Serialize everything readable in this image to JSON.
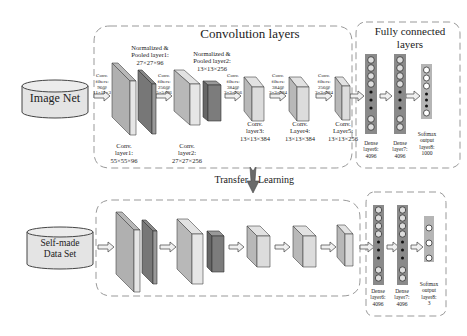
{
  "top": {
    "dataset_label": "Image Net",
    "conv_section_title": "Convolution layers",
    "fc_section_title_line1": "Fully connected",
    "fc_section_title_line2": "layers",
    "arrows": [
      {
        "l1": "Conv.",
        "l2": "filters:",
        "l3": "96@",
        "l4": "11×11×3"
      },
      {
        "l1": "Conv.",
        "l2": "filters:",
        "l3": "256@",
        "l4": "5×5×96"
      },
      {
        "l1": "Conv.",
        "l2": "filters:",
        "l3": "384@",
        "l4": "3×3×256"
      },
      {
        "l1": "Conv.",
        "l2": "filters:",
        "l3": "384@",
        "l4": "3×3×384"
      },
      {
        "l1": "Conv.",
        "l2": "filters:",
        "l3": "256@",
        "l4": "3×3×384"
      }
    ],
    "pooled1": {
      "l1": "Normalized &",
      "l2": "Pooled layer1:",
      "l3": "27×27×96"
    },
    "pooled2": {
      "l1": "Normalized &",
      "l2": "Pooled layer2:",
      "l3": "13×13×256"
    },
    "conv1": {
      "l1": "Conv.",
      "l2": "layer1:",
      "l3": "55×55×96"
    },
    "conv2": {
      "l1": "Conv.",
      "l2": "layer2:",
      "l3": "27×27×256"
    },
    "conv3": {
      "l1": "Conv.",
      "l2": "layer3:",
      "l3": "13×13×384"
    },
    "conv4": {
      "l1": "Conv.",
      "l2": "Layer4:",
      "l3": "13×13×384"
    },
    "conv5": {
      "l1": "Conv.",
      "l2": "Layer5:",
      "l3": "13×13×256"
    },
    "dense6": {
      "l1": "Dense",
      "l2": "layer6:",
      "l3": "4096"
    },
    "dense7": {
      "l1": "Dense",
      "l2": "layer7:",
      "l3": "4096"
    },
    "softmax": {
      "l1": "Softmax",
      "l2": "output",
      "l3": "layer8:",
      "l4": "1000"
    }
  },
  "transfer": {
    "left": "Transfer",
    "right": "Learning"
  },
  "bottom": {
    "dataset_line1": "Self-made",
    "dataset_line2": "Data Set",
    "dense6": {
      "l1": "Dense",
      "l2": "layer6:",
      "l3": "4096"
    },
    "dense7": {
      "l1": "Dense",
      "l2": "layer7:",
      "l3": "4096"
    },
    "softmax": {
      "l1": "Softmax",
      "l2": "output",
      "l3": "layer8:",
      "l4": "3"
    }
  },
  "colors": {
    "layer_light": "#c8c8c8",
    "layer_dark": "#6e6e6e",
    "dense_bar": "#8a8a8a",
    "dashed_border": "#999999"
  }
}
